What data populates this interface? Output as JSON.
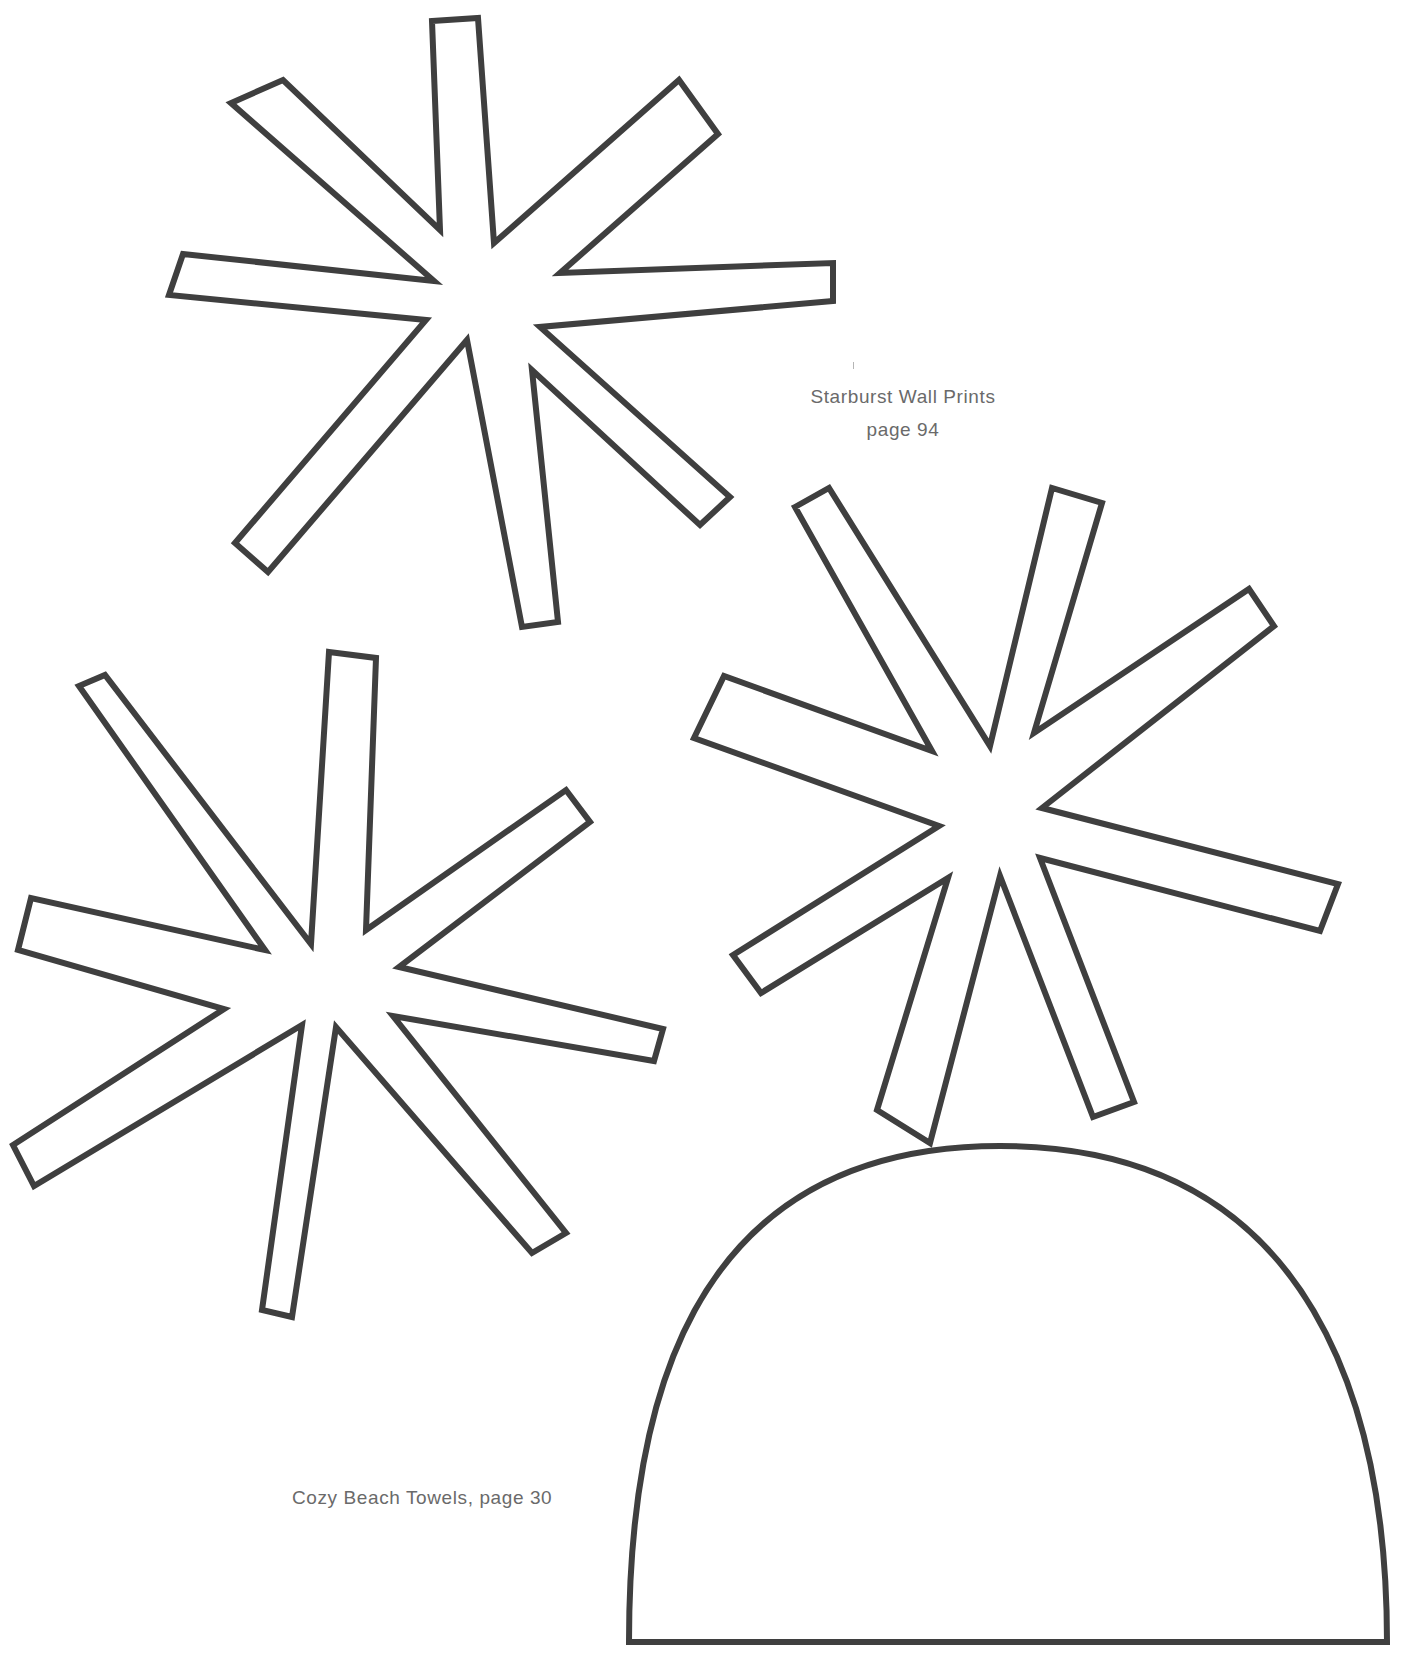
{
  "page": {
    "background": "#ffffff",
    "outline_color": "#3f3f3f",
    "caption_color": "#6a6a6a"
  },
  "captions": {
    "starburst": {
      "title": "Starburst Wall Prints",
      "page": "page 94"
    },
    "beach_towels": {
      "label": "Cozy Beach Towels, page 30"
    }
  },
  "templates": [
    {
      "name": "starburst-top",
      "type": "starburst",
      "points": "432,21 478,18 494,243 679,80 718,134 560,273 833,263 833,301 540,327 730,497 700,525 532,370 558,622 522,627 467,340 268,572 235,543 426,320 169,295 183,254 434,281 231,103 283,80 440,230"
    },
    {
      "name": "starburst-left",
      "type": "starburst",
      "points": "329,652 376,658 366,930 566,790 590,822 399,967 663,1029 654,1061 393,1016 566,1233 532,1253 336,1027 292,1317 262,1310 302,1025 34,1186 13,1145 224,1009 18,950 31,898 265,950 79,686 105,675 311,944"
    },
    {
      "name": "starburst-right",
      "type": "starburst",
      "points": "795,507 829,488 990,746 1052,488 1102,503 1034,733 1249,589 1274,626 1042,808 1338,884 1320,931 1040,858 1134,1102 1093,1117 1000,876 930,1143 877,1110 948,878 761,993 733,955 939,826 694,738 724,676 932,751"
    },
    {
      "name": "towel-dome",
      "type": "dome",
      "path": "M 629 1642 L 1387 1642 C 1387 1420 1320 1146 1000 1146 C 680 1146 629 1420 629 1642 Z"
    }
  ]
}
